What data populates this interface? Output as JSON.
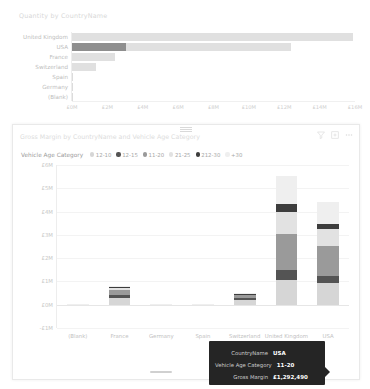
{
  "top_visual": {
    "title": "Quantity by CountryName",
    "icons": [],
    "chart_data": {
      "type": "bar",
      "orientation": "horizontal",
      "title": "Quantity by CountryName",
      "xlabel": "",
      "ylabel": "",
      "categories": [
        "United Kingdom",
        "USA",
        "France",
        "Switzerland",
        "Spain",
        "Germany",
        "(Blank)"
      ],
      "tick_labels": [
        "£0M",
        "£2M",
        "£4M",
        "£6M",
        "£8M",
        "£10M",
        "£12M",
        "£14M",
        "£16M"
      ],
      "xlim": [
        0,
        16
      ],
      "values": [
        15.9,
        12.4,
        2.45,
        1.35,
        0.05,
        0.04,
        0.03
      ],
      "highlight_values": [
        0.0,
        3.05,
        0.0,
        0.0,
        0.0,
        0.0,
        0.0
      ],
      "grid": false,
      "legend": "none"
    }
  },
  "bottom_visual": {
    "title": "Gross Margin by CountryName and Vehicle Age Category",
    "legend_title": "Vehicle Age Category",
    "icons": [
      "filter-icon",
      "focus-mode-icon",
      "more-options-icon"
    ],
    "chart_data": {
      "type": "bar",
      "stacked": true,
      "title": "Gross Margin by CountryName and Vehicle Age Category",
      "xlabel": "",
      "ylabel": "",
      "categories": [
        "(Blank)",
        "France",
        "Germany",
        "Spain",
        "Switzerland",
        "United Kingdom",
        "USA"
      ],
      "tick_labels": [
        "£6M",
        "£5M",
        "£4M",
        "£3M",
        "£2M",
        "£1M",
        "£0M",
        "-£1M"
      ],
      "ylim": [
        -1,
        6
      ],
      "grid": true,
      "legend_position": "top",
      "series": [
        {
          "name": "12-10",
          "color": "#d6d6d6",
          "values": [
            0.02,
            0.3,
            0.01,
            0.01,
            0.22,
            1.05,
            0.95
          ]
        },
        {
          "name": "12-15",
          "color": "#545454",
          "values": [
            0.0,
            0.1,
            0.0,
            0.0,
            0.06,
            0.42,
            0.3
          ]
        },
        {
          "name": "11-20",
          "color": "#9a9a9a",
          "values": [
            0.01,
            0.22,
            0.01,
            0.01,
            0.12,
            1.55,
            1.29
          ]
        },
        {
          "name": "21-25",
          "color": "#e2e2e2",
          "values": [
            0.01,
            0.1,
            0.0,
            0.0,
            0.06,
            0.95,
            0.72
          ]
        },
        {
          "name": "212-30",
          "color": "#3d3d3d",
          "values": [
            0.0,
            0.04,
            0.0,
            0.0,
            0.02,
            0.35,
            0.22
          ]
        },
        {
          "name": "+30",
          "color": "#efefef",
          "values": [
            0.0,
            0.04,
            0.0,
            0.0,
            0.02,
            1.2,
            0.92
          ]
        }
      ]
    },
    "tooltip": {
      "rows": [
        {
          "key": "CountryName",
          "value": "USA"
        },
        {
          "key": "Vehicle Age Category",
          "value": "11-20"
        },
        {
          "key": "Gross Margin",
          "value": "£1,292,490"
        }
      ]
    }
  }
}
